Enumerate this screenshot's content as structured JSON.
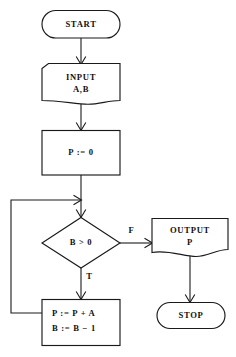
{
  "diagram": {
    "nodes": {
      "start": {
        "label": "START",
        "shape": "terminator"
      },
      "input": {
        "line1": "INPUT",
        "line2": "A,B",
        "shape": "document"
      },
      "init": {
        "label": "P := 0",
        "shape": "process"
      },
      "decision": {
        "label": "B > 0",
        "shape": "decision"
      },
      "output": {
        "line1": "OUTPUT",
        "line2": "P",
        "shape": "document"
      },
      "loop_body": {
        "line1": "P := P + A",
        "line2": "B := B − 1",
        "shape": "process"
      },
      "stop": {
        "label": "STOP",
        "shape": "terminator"
      }
    },
    "branch_labels": {
      "false": "F",
      "true": "T"
    },
    "colors": {
      "stroke": "#1a1a1a",
      "fill": "#ffffff",
      "text": "#101010"
    }
  }
}
